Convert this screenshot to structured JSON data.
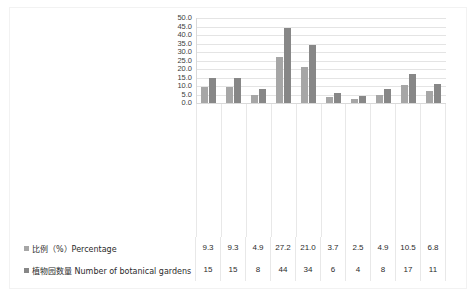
{
  "chart_data": {
    "type": "bar",
    "title": "",
    "subtitle": "",
    "xlabel": "",
    "ylabel": "",
    "ylim": [
      0,
      50
    ],
    "yticks": [
      "50.0",
      "45.0",
      "40.0",
      "35.0",
      "30.0",
      "25.0",
      "20.0",
      "15.0",
      "10.0",
      "5.0",
      "0.0"
    ],
    "grid": true,
    "legend_position": "bottom-table",
    "categories": [
      "中国科学院CAS",
      "教育部门 Education Department",
      "住房与建设部门 Housing/Urban-Rural Department",
      "林业部门 Forest Department",
      "园林部门 Landscaping Department",
      "农业部门 Agricultural Department",
      "医药部门 Medical/Medicinal Department",
      "科技部门 Sci-Tech Department",
      "港澳台 Hong Kong, Macao and Taiwan",
      "企业/其他Enterprises/others"
    ],
    "categories_zh": [
      "中国科学院CAS",
      "教育部门",
      "住房与建设部门",
      "林业部门",
      "园林部门",
      "农业部门",
      "医药部门",
      "科技部门",
      "港澳台",
      "企业/其他Enterprises/others"
    ],
    "categories_en": [
      "",
      "Education Department",
      "Housing/Urban-Rural Department",
      "Forest Department",
      "Landscaping Department",
      "Agricultural Department",
      "Medical/Medicinal Department",
      "Sci-Tech Department",
      "Hong Kong, Macao and Taiwan",
      ""
    ],
    "series": [
      {
        "name": "比例（%）Percentage",
        "color": "#a6a6a6",
        "values": [
          9.3,
          9.3,
          4.9,
          27.2,
          21.0,
          3.7,
          2.5,
          4.9,
          10.5,
          6.8
        ],
        "display": [
          "9.3",
          "9.3",
          "4.9",
          "27.2",
          "21.0",
          "3.7",
          "2.5",
          "4.9",
          "10.5",
          "6.8"
        ]
      },
      {
        "name": "植物园数量 Number of botanical gardens",
        "color": "#878787",
        "values": [
          15,
          15,
          8,
          44,
          34,
          6,
          4,
          8,
          17,
          11
        ],
        "display": [
          "15",
          "15",
          "8",
          "44",
          "34",
          "6",
          "4",
          "8",
          "17",
          "11"
        ]
      }
    ]
  }
}
